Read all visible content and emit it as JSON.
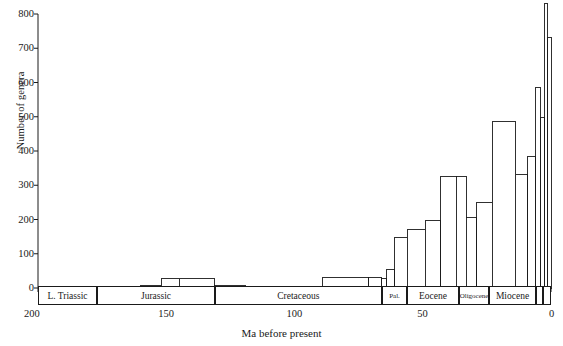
{
  "chart_data": {
    "type": "bar",
    "title": "",
    "xlabel": "Ma before present",
    "ylabel": "Number of genera",
    "xlim": [
      200,
      0
    ],
    "ylim": [
      0,
      800
    ],
    "x_ticks": [
      200,
      150,
      100,
      50,
      0
    ],
    "y_ticks": [
      0,
      100,
      200,
      300,
      400,
      500,
      600,
      700,
      800
    ],
    "grid": false,
    "legend": null,
    "axis_direction": "x-reversed",
    "bin_unit": "Ma",
    "bars": [
      {
        "x_start": 200,
        "x_end": 183,
        "value": 3,
        "epoch": "L. Triassic"
      },
      {
        "x_start": 183,
        "x_end": 175,
        "value": 2,
        "epoch": "L. Triassic"
      },
      {
        "x_start": 175,
        "x_end": 160,
        "value": 2,
        "epoch": "Jurassic"
      },
      {
        "x_start": 160,
        "x_end": 152,
        "value": 6,
        "epoch": "Jurassic"
      },
      {
        "x_start": 152,
        "x_end": 145,
        "value": 28,
        "epoch": "Jurassic"
      },
      {
        "x_start": 145,
        "x_end": 131,
        "value": 28,
        "epoch": "Jurassic"
      },
      {
        "x_start": 131,
        "x_end": 119,
        "value": 7,
        "epoch": "Cretaceous"
      },
      {
        "x_start": 119,
        "x_end": 97,
        "value": 5,
        "epoch": "Cretaceous"
      },
      {
        "x_start": 97,
        "x_end": 89,
        "value": 5,
        "epoch": "Cretaceous"
      },
      {
        "x_start": 89,
        "x_end": 71,
        "value": 32,
        "epoch": "Cretaceous"
      },
      {
        "x_start": 71,
        "x_end": 66,
        "value": 32,
        "epoch": "Cretaceous"
      },
      {
        "x_start": 66,
        "x_end": 64,
        "value": 27,
        "epoch": "Pal."
      },
      {
        "x_start": 64,
        "x_end": 61,
        "value": 53,
        "epoch": "Pal."
      },
      {
        "x_start": 61,
        "x_end": 56,
        "value": 148,
        "epoch": "Pal."
      },
      {
        "x_start": 56,
        "x_end": 49,
        "value": 170,
        "epoch": "Eocene"
      },
      {
        "x_start": 49,
        "x_end": 43,
        "value": 198,
        "epoch": "Eocene"
      },
      {
        "x_start": 43,
        "x_end": 37,
        "value": 325,
        "epoch": "Eocene"
      },
      {
        "x_start": 37,
        "x_end": 33,
        "value": 325,
        "epoch": "Oligocene"
      },
      {
        "x_start": 33,
        "x_end": 29,
        "value": 205,
        "epoch": "Oligocene"
      },
      {
        "x_start": 29,
        "x_end": 23,
        "value": 250,
        "epoch": "Oligocene"
      },
      {
        "x_start": 23,
        "x_end": 14,
        "value": 487,
        "epoch": "Miocene"
      },
      {
        "x_start": 14,
        "x_end": 9,
        "value": 332,
        "epoch": "Miocene"
      },
      {
        "x_start": 9,
        "x_end": 6,
        "value": 385,
        "epoch": "Miocene"
      },
      {
        "x_start": 6,
        "x_end": 4,
        "value": 585,
        "epoch": "Pliocene"
      },
      {
        "x_start": 4,
        "x_end": 2.5,
        "value": 498,
        "epoch": "Pliocene"
      },
      {
        "x_start": 2.5,
        "x_end": 1.2,
        "value": 830,
        "epoch": "Pleistocene"
      },
      {
        "x_start": 1.2,
        "x_end": 0,
        "value": 730,
        "epoch": "Pleistocene"
      }
    ],
    "epoch_bands": [
      {
        "label": "L. Triassic",
        "x_start": 200,
        "x_end": 177
      },
      {
        "label": "Jurassic",
        "x_start": 177,
        "x_end": 131
      },
      {
        "label": "Cretaceous",
        "x_start": 131,
        "x_end": 66
      },
      {
        "label": "Pal.",
        "x_start": 66,
        "x_end": 56
      },
      {
        "label": "Eocene",
        "x_start": 56,
        "x_end": 36
      },
      {
        "label": "Oligocene",
        "x_start": 36,
        "x_end": 24
      },
      {
        "label": "Miocene",
        "x_start": 24,
        "x_end": 6
      },
      {
        "label": "",
        "x_start": 6,
        "x_end": 3
      },
      {
        "label": "",
        "x_start": 3,
        "x_end": 0
      }
    ]
  },
  "axes": {
    "y_tick_labels": [
      "800",
      "700",
      "600",
      "500",
      "400",
      "300",
      "200",
      "100",
      "0"
    ],
    "x_tick_labels": [
      "200",
      "150",
      "100",
      "50",
      "0"
    ],
    "y_axis_title": "Number of genera",
    "x_axis_title": "Ma before present"
  }
}
